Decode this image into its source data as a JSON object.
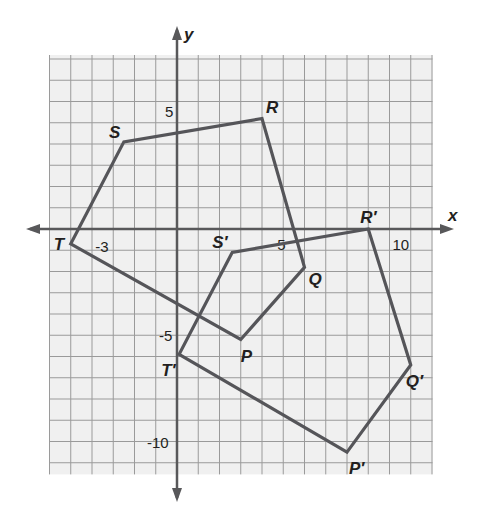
{
  "chart_data": {
    "type": "scatter",
    "title": "",
    "xlabel": "x",
    "ylabel": "y",
    "xlim": [
      -6,
      12
    ],
    "ylim": [
      -11.5,
      8
    ],
    "grid": true,
    "x_tick_labels": [
      {
        "value": -3,
        "text": "-3"
      },
      {
        "value": 5,
        "text": "5"
      },
      {
        "value": 10,
        "text": "10"
      }
    ],
    "y_tick_labels": [
      {
        "value": 5,
        "text": "5"
      },
      {
        "value": -5,
        "text": "-5"
      },
      {
        "value": -10,
        "text": "-10"
      }
    ],
    "series": [
      {
        "name": "PQRST",
        "closed": true,
        "points": [
          {
            "label": "P",
            "x": 3,
            "y": -5.2
          },
          {
            "label": "Q",
            "x": 6,
            "y": -1.8
          },
          {
            "label": "R",
            "x": 4,
            "y": 5.2
          },
          {
            "label": "S",
            "x": -2.5,
            "y": 4.1
          },
          {
            "label": "T",
            "x": -5,
            "y": -0.7
          }
        ]
      },
      {
        "name": "P'Q'R'S'T'",
        "closed": true,
        "points": [
          {
            "label": "P′",
            "x": 8,
            "y": -10.5
          },
          {
            "label": "Q′",
            "x": 11,
            "y": -6.4
          },
          {
            "label": "R′",
            "x": 9,
            "y": 0
          },
          {
            "label": "S′",
            "x": 2.6,
            "y": -1.1
          },
          {
            "label": "T′",
            "x": 0.1,
            "y": -5.9
          }
        ]
      }
    ]
  },
  "colors": {
    "polygon": "#555559",
    "grid": "#9a9a9a",
    "background": "#f0f0f0",
    "axis": "#58585a"
  }
}
